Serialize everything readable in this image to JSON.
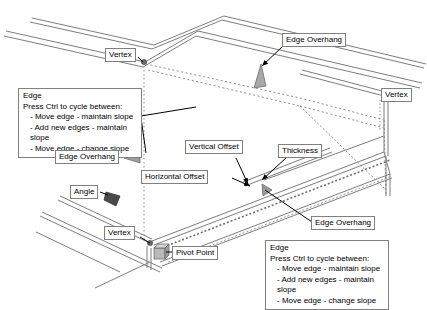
{
  "diagram": {
    "background_color": "#ffffff",
    "line_color": "#808080",
    "leader_color": "#000000",
    "label_border_color": "#808080",
    "label_text_color": "#000000"
  },
  "labels": {
    "vertex_top": "Vertex",
    "vertex_right": "Vertex",
    "vertex_bottom": "Vertex",
    "edge_overhang_top": "Edge Overhang",
    "edge_overhang_left": "Edge Overhang",
    "edge_overhang_right": "Edge Overhang",
    "vertical_offset": "Vertical Offset",
    "horizontal_offset": "Horizontal Offset",
    "thickness": "Thickness",
    "angle": "Angle",
    "pivot_point": "Pivot Point"
  },
  "edge_callout": {
    "heading": "Edge",
    "instruction": "Press Ctrl to cycle between:",
    "options": [
      "- Move edge - maintain slope",
      "- Add new edges - maintain slope",
      "- Move edge - change slope"
    ]
  }
}
